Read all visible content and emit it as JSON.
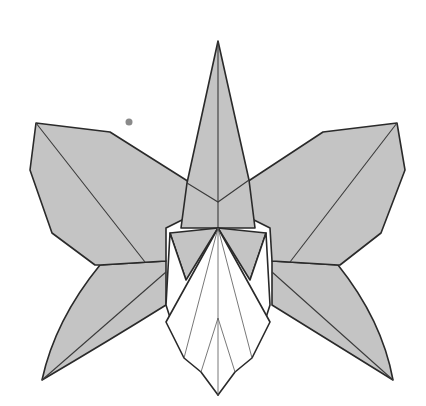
{
  "diagram": {
    "colors": {
      "paper_colored_side": "#c4c4c4",
      "paper_white_side": "#ffffff",
      "line": "#2a2a2a",
      "background": "#ffffff",
      "speck": "#8a8a8a"
    },
    "parts": [
      "dorsal-sepal",
      "left-petal",
      "right-petal",
      "left-lateral-sepal",
      "right-lateral-sepal",
      "column",
      "lip"
    ]
  }
}
